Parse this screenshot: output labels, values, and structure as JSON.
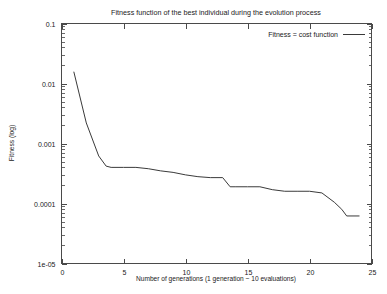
{
  "chart_data": {
    "type": "line",
    "title": "Fitness function of the best individual during the evolution process",
    "xlabel": "Number of generations (1 generation ~ 10 evaluations)",
    "ylabel": "Fitness (log)",
    "xlim": [
      0,
      25
    ],
    "ylim": [
      1e-05,
      0.1
    ],
    "yscale": "log",
    "xscale": "linear",
    "grid": false,
    "legend_position": "top-right",
    "xticks": [
      0,
      5,
      10,
      15,
      20,
      25
    ],
    "xtick_labels": [
      "0",
      "5",
      "10",
      "15",
      "20",
      "25"
    ],
    "yticks": [
      1e-05,
      0.0001,
      0.001,
      0.01,
      0.1
    ],
    "ytick_labels": [
      "1e-05",
      "0.0001",
      "0.001",
      "0.01",
      "0.1"
    ],
    "series": [
      {
        "name": "Fitness = cost function",
        "color": "#3a3a3a",
        "x": [
          1,
          2,
          3,
          3.6,
          4,
          5,
          6,
          7,
          8,
          9,
          10,
          11,
          12,
          13,
          13.6,
          14,
          15,
          16,
          17,
          18,
          19,
          20,
          21,
          22,
          22.6,
          23,
          24
        ],
        "y": [
          0.0155,
          0.0022,
          0.00062,
          0.00042,
          0.0004,
          0.0004,
          0.0004,
          0.00038,
          0.00035,
          0.00033,
          0.0003,
          0.00028,
          0.00027,
          0.00027,
          0.00019,
          0.00019,
          0.00019,
          0.00019,
          0.00017,
          0.00016,
          0.00016,
          0.00016,
          0.00015,
          0.000105,
          8e-05,
          6.2e-05,
          6.2e-05
        ]
      }
    ]
  },
  "legend": {
    "entries": [
      {
        "label": "Fitness = cost function"
      }
    ]
  }
}
